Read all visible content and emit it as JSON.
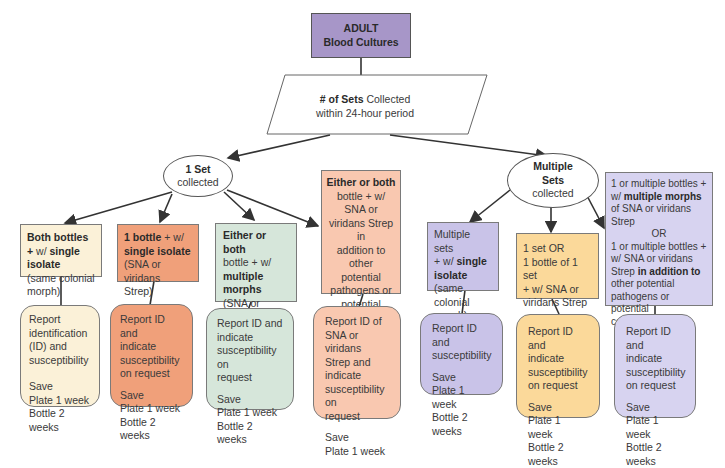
{
  "colors": {
    "purple_header": "#a796c8",
    "cream": "#fbf1d8",
    "orange": "#f0a07a",
    "green": "#d6e6da",
    "peach": "#f9c8b0",
    "lavender": "#c9c3e8",
    "yellow": "#fbd99a",
    "lavender_light": "#d7d3f0"
  },
  "root": {
    "line1": "ADULT",
    "line2": "Blood Cultures"
  },
  "decision": {
    "bold": "# of Sets",
    "text1": " Collected",
    "text2": "within 24-hour period"
  },
  "one_set": {
    "bold": "1 Set",
    "text": "collected"
  },
  "multi_sets": {
    "bold1": "Multiple",
    "bold2": "Sets",
    "text": "collected"
  },
  "conditions": [
    {
      "id": "c1",
      "parts": [
        "Both bottles +",
        "w/",
        "single isolate",
        "(same colonial",
        "morph)"
      ]
    },
    {
      "id": "c2",
      "parts": [
        "1 bottle",
        "+ w/",
        "single isolate",
        "(SNA or viridans",
        "Strep)"
      ]
    },
    {
      "id": "c3",
      "parts": [
        "Either or both",
        "bottle + w/",
        "multiple",
        "morphs",
        "(SNA or viridans",
        "Strep)"
      ]
    },
    {
      "id": "c4",
      "parts": [
        "Either or both",
        "bottle + w/",
        "SNA or",
        "viridans Strep in",
        "addition to other",
        "potential",
        "pathogens or",
        "potential",
        "contaminants"
      ]
    },
    {
      "id": "c5",
      "parts": [
        "Multiple sets",
        "+ w/",
        "single",
        "isolate",
        "(same colonial",
        "morph)"
      ]
    },
    {
      "id": "c6",
      "parts": [
        "1 set OR",
        "1 bottle of 1 set",
        "+ w/ SNA or",
        "viridans Strep"
      ]
    },
    {
      "id": "c7",
      "parts": [
        "1 or multiple bottles +",
        "w/",
        "multiple morphs",
        "of SNA or viridans",
        "Strep",
        "OR",
        "1 or multiple bottles +",
        "w/ SNA or viridans",
        "Strep",
        "in addition to",
        "other potential",
        "pathogens or potential",
        "contaminants"
      ]
    }
  ],
  "actions": [
    {
      "report": [
        "Report",
        "identification",
        "(ID) and",
        "susceptibility"
      ],
      "save": [
        "Save",
        "Plate 1 week",
        "Bottle 2 weeks"
      ]
    },
    {
      "report": [
        "Report ID and",
        "indicate",
        "susceptibility",
        "on request"
      ],
      "save": [
        "Save",
        "Plate 1 week",
        "Bottle 2 weeks"
      ]
    },
    {
      "report": [
        "Report ID and",
        "indicate",
        "susceptibility on",
        "request"
      ],
      "save": [
        "Save",
        "Plate 1 week",
        "Bottle 2 weeks"
      ]
    },
    {
      "report": [
        "Report ID of",
        "SNA or viridans",
        "Strep and",
        "indicate",
        "susceptibility on",
        "request"
      ],
      "save": [
        "Save",
        "Plate 1 week"
      ]
    },
    {
      "report": [
        "Report ID and",
        "susceptibility"
      ],
      "save": [
        "Save",
        "Plate 1 week",
        "Bottle 2 weeks"
      ]
    },
    {
      "report": [
        "Report ID and",
        "indicate",
        "susceptibility",
        "on request"
      ],
      "save": [
        "Save",
        "Plate 1 week",
        "Bottle 2 weeks"
      ]
    },
    {
      "report": [
        "Report ID and",
        "indicate",
        "susceptibility",
        "on request"
      ],
      "save": [
        "Save",
        "Plate 1 week",
        "Bottle 2 weeks"
      ]
    }
  ]
}
